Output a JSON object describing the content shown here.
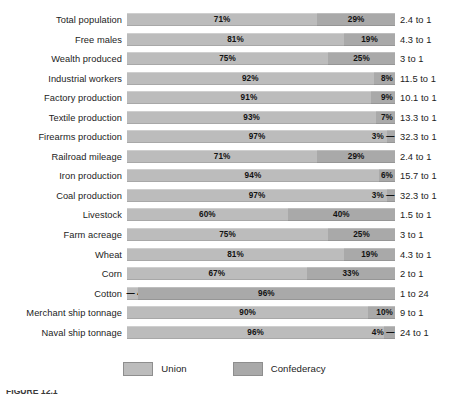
{
  "legend": {
    "items": [
      {
        "label": "Union",
        "color": "#bcbcbc",
        "swatch": "union-swatch"
      },
      {
        "label": "Confederacy",
        "color": "#a9a9a9",
        "swatch": "confederacy-swatch"
      }
    ]
  },
  "caption": {
    "text": "FIGURE 12.1"
  },
  "chart_data": {
    "type": "bar",
    "subtype": "100% stacked horizontal bar",
    "title": "",
    "xlabel": "",
    "ylabel": "",
    "xlim": [
      0,
      100
    ],
    "grid": false,
    "legend_position": "bottom-center",
    "series": [
      {
        "name": "Union",
        "color": "#bcbcbc",
        "values": [
          71,
          81,
          75,
          92,
          91,
          93,
          97,
          71,
          94,
          97,
          60,
          75,
          81,
          67,
          4,
          90,
          96
        ]
      },
      {
        "name": "Confederacy",
        "color": "#a9a9a9",
        "values": [
          29,
          19,
          25,
          8,
          9,
          7,
          3,
          29,
          6,
          3,
          40,
          25,
          19,
          33,
          96,
          10,
          4
        ]
      }
    ],
    "categories": [
      "Total population",
      "Free males",
      "Wealth produced",
      "Industrial workers",
      "Factory production",
      "Textile production",
      "Firearms production",
      "Railroad mileage",
      "Iron production",
      "Coal production",
      "Livestock",
      "Farm acreage",
      "Wheat",
      "Corn",
      "Cotton",
      "Merchant ship tonnage",
      "Naval ship tonnage"
    ],
    "annotations": [
      "2.4 to 1",
      "4.3 to 1",
      "3 to 1",
      "11.5 to 1",
      "10.1 to 1",
      "13.3 to 1",
      "32.3 to 1",
      "2.4 to 1",
      "15.7 to 1",
      "32.3 to 1",
      "1.5 to 1",
      "3 to 1",
      "4.3 to 1",
      "2 to 1",
      "1 to 24",
      "9 to 1",
      "24 to 1"
    ],
    "rows": [
      {
        "label": "Total population",
        "union": 71,
        "confederacy": 29,
        "union_text": "71%",
        "confederacy_text": "29%",
        "ratio": "2.4 to 1",
        "union_label_placement": "center",
        "confederacy_label_placement": "center"
      },
      {
        "label": "Free males",
        "union": 81,
        "confederacy": 19,
        "union_text": "81%",
        "confederacy_text": "19%",
        "ratio": "4.3 to 1",
        "union_label_placement": "center",
        "confederacy_label_placement": "center"
      },
      {
        "label": "Wealth produced",
        "union": 75,
        "confederacy": 25,
        "union_text": "75%",
        "confederacy_text": "25%",
        "ratio": "3 to 1",
        "union_label_placement": "center",
        "confederacy_label_placement": "center"
      },
      {
        "label": "Industrial workers",
        "union": 92,
        "confederacy": 8,
        "union_text": "92%",
        "confederacy_text": "8%",
        "ratio": "11.5 to 1",
        "union_label_placement": "center",
        "confederacy_label_placement": "pin-right"
      },
      {
        "label": "Factory production",
        "union": 91,
        "confederacy": 9,
        "union_text": "91%",
        "confederacy_text": "9%",
        "ratio": "10.1 to 1",
        "union_label_placement": "center",
        "confederacy_label_placement": "pin-right"
      },
      {
        "label": "Textile production",
        "union": 93,
        "confederacy": 7,
        "union_text": "93%",
        "confederacy_text": "7%",
        "ratio": "13.3 to 1",
        "union_label_placement": "center",
        "confederacy_label_placement": "pin-right"
      },
      {
        "label": "Firearms production",
        "union": 97,
        "confederacy": 3,
        "union_text": "97%",
        "confederacy_text": "3% —",
        "ratio": "32.3 to 1",
        "union_label_placement": "center",
        "confederacy_label_placement": "outside-right"
      },
      {
        "label": "Railroad mileage",
        "union": 71,
        "confederacy": 29,
        "union_text": "71%",
        "confederacy_text": "29%",
        "ratio": "2.4 to 1",
        "union_label_placement": "center",
        "confederacy_label_placement": "center"
      },
      {
        "label": "Iron production",
        "union": 94,
        "confederacy": 6,
        "union_text": "94%",
        "confederacy_text": "6%",
        "ratio": "15.7 to 1",
        "union_label_placement": "center",
        "confederacy_label_placement": "pin-right"
      },
      {
        "label": "Coal production",
        "union": 97,
        "confederacy": 3,
        "union_text": "97%",
        "confederacy_text": "3% —",
        "ratio": "32.3 to 1",
        "union_label_placement": "center",
        "confederacy_label_placement": "outside-right"
      },
      {
        "label": "Livestock",
        "union": 60,
        "confederacy": 40,
        "union_text": "60%",
        "confederacy_text": "40%",
        "ratio": "1.5 to 1",
        "union_label_placement": "center",
        "confederacy_label_placement": "center"
      },
      {
        "label": "Farm acreage",
        "union": 75,
        "confederacy": 25,
        "union_text": "75%",
        "confederacy_text": "25%",
        "ratio": "3 to 1",
        "union_label_placement": "center",
        "confederacy_label_placement": "center"
      },
      {
        "label": "Wheat",
        "union": 81,
        "confederacy": 19,
        "union_text": "81%",
        "confederacy_text": "19%",
        "ratio": "4.3 to 1",
        "union_label_placement": "center",
        "confederacy_label_placement": "center"
      },
      {
        "label": "Corn",
        "union": 67,
        "confederacy": 33,
        "union_text": "67%",
        "confederacy_text": "33%",
        "ratio": "2 to 1",
        "union_label_placement": "center",
        "confederacy_label_placement": "center"
      },
      {
        "label": "Cotton",
        "union": 4,
        "confederacy": 96,
        "union_text": "— 4%",
        "confederacy_text": "96%",
        "ratio": "1 to 24",
        "union_label_placement": "outside-left",
        "confederacy_label_placement": "center"
      },
      {
        "label": "Merchant ship tonnage",
        "union": 90,
        "confederacy": 10,
        "union_text": "90%",
        "confederacy_text": "10%",
        "ratio": "9 to 1",
        "union_label_placement": "center",
        "confederacy_label_placement": "pin-right"
      },
      {
        "label": "Naval ship tonnage",
        "union": 96,
        "confederacy": 4,
        "union_text": "96%",
        "confederacy_text": "4% —",
        "ratio": "24 to 1",
        "union_label_placement": "center",
        "confederacy_label_placement": "outside-right"
      }
    ]
  }
}
